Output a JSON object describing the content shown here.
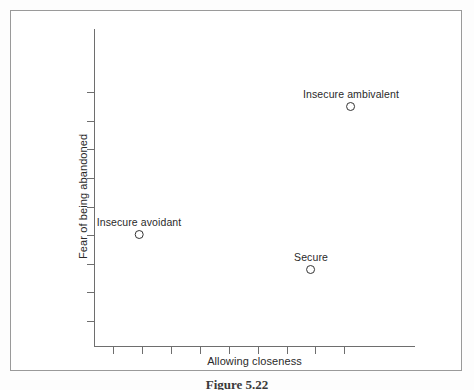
{
  "figure": {
    "caption": "Figure 5.22"
  },
  "chart_data": {
    "type": "scatter",
    "title": "",
    "xlabel": "Allowing closeness",
    "ylabel": "Fear of being abandoned",
    "xlim": [
      0,
      10
    ],
    "ylim": [
      0,
      10
    ],
    "grid": false,
    "legend": "none",
    "axis_tick_labels": {
      "x": [
        "",
        "",
        "",
        "",
        "",
        "",
        "",
        "",
        ""
      ],
      "y": [
        "",
        "",
        "",
        "",
        "",
        "",
        "",
        "",
        ""
      ]
    },
    "x_tick_positions": [
      0.6,
      1.5,
      2.4,
      3.3,
      4.2,
      5.1,
      6.0,
      6.9,
      7.8
    ],
    "y_tick_positions": [
      0.8,
      1.7,
      2.6,
      3.5,
      4.4,
      5.3,
      6.2,
      7.1,
      8.0
    ],
    "points": [
      {
        "label": "Insecure ambivalent",
        "x": 8.03,
        "y": 7.69,
        "px": 350,
        "py": 101,
        "marker": "open-circle"
      },
      {
        "label": "Insecure avoidant",
        "x": 1.41,
        "y": 3.66,
        "px": 138,
        "py": 229,
        "marker": "open-circle"
      },
      {
        "label": "Secure",
        "x": 6.78,
        "y": 2.55,
        "px": 310,
        "py": 264,
        "marker": "open-circle"
      }
    ]
  }
}
